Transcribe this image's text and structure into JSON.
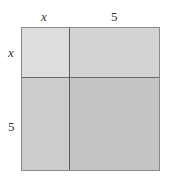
{
  "diagram": {
    "top_labels": [
      "x",
      "5"
    ],
    "side_labels": [
      "x",
      "5"
    ],
    "regions": [
      {
        "name": "x-by-x",
        "color": "#dddddd"
      },
      {
        "name": "x-by-5",
        "color": "#d3d3d3"
      },
      {
        "name": "5-by-x",
        "color": "#cccccc"
      },
      {
        "name": "5-by-5",
        "color": "#c4c4c4"
      }
    ]
  }
}
